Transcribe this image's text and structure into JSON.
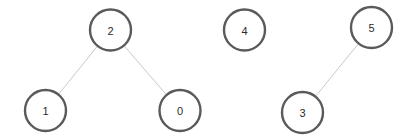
{
  "graph": {
    "background_color": "#ffffff",
    "node_stroke_color": "#5a5a5a",
    "node_fill_color": "#ffffff",
    "node_stroke_width": 2.4,
    "node_radius": 20.5,
    "node_label_color": "#2b2b2b",
    "edge_color": "#c9c9c9",
    "edge_width": 1,
    "nodes": [
      {
        "id": "2",
        "label": "2",
        "cx": 110.5,
        "cy": 30.0
      },
      {
        "id": "1",
        "label": "1",
        "cx": 45.5,
        "cy": 110.5
      },
      {
        "id": "0",
        "label": "0",
        "cx": 180.0,
        "cy": 110.5
      },
      {
        "id": "4",
        "label": "4",
        "cx": 244.5,
        "cy": 30.0
      },
      {
        "id": "5",
        "label": "5",
        "cx": 371.5,
        "cy": 27.5
      },
      {
        "id": "3",
        "label": "3",
        "cx": 302.5,
        "cy": 112.5
      }
    ],
    "edges": [
      {
        "id": "edge-2-1",
        "source": "2",
        "target": "1"
      },
      {
        "id": "edge-2-0",
        "source": "2",
        "target": "0"
      },
      {
        "id": "edge-5-3",
        "source": "5",
        "target": "3"
      }
    ]
  }
}
